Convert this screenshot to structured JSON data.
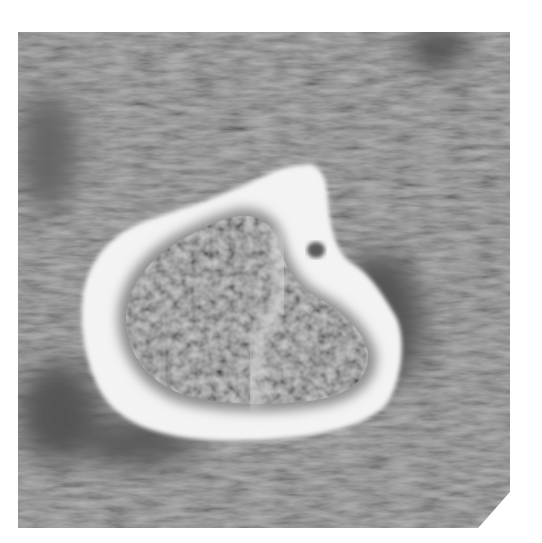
{
  "image": {
    "description": "Axial CT cross-section of a bone showing bright cortical shell and darker trabecular interior",
    "modality": "CT",
    "colors": {
      "background_tissue": "#7a7a7a",
      "dark_tissue": "#4a4a4a",
      "cortical_bone": "#f4f4f4",
      "trabecular_bone": "#8e8e8e",
      "page_background": "#ffffff"
    }
  }
}
